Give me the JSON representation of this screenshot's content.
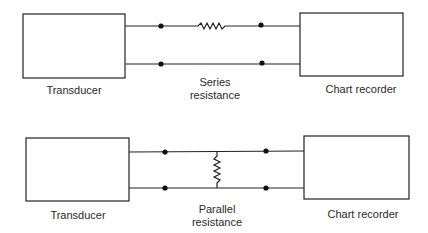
{
  "diagrams": [
    {
      "name": "series",
      "left_box": {
        "label": "Transducer"
      },
      "right_box": {
        "label": "Chart recorder"
      },
      "resistor": {
        "label_line1": "Series",
        "label_line2": "resistance",
        "orientation": "horizontal"
      }
    },
    {
      "name": "parallel",
      "left_box": {
        "label": "Transducer"
      },
      "right_box": {
        "label": "Chart recorder"
      },
      "resistor": {
        "label_line1": "Parallel",
        "label_line2": "resistance",
        "orientation": "vertical"
      }
    }
  ],
  "colors": {
    "line": "#222222",
    "text": "#2a2a2a",
    "background": "#ffffff"
  }
}
